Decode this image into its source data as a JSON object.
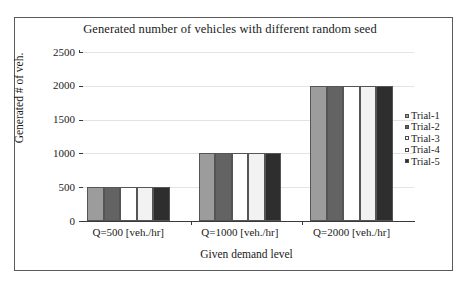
{
  "figure": {
    "background_color": "#ffffff",
    "frame_color": "#5a5a5a"
  },
  "chart_data": {
    "type": "bar",
    "title": "Generated number of vehicles with different random seed",
    "xlabel": "Given demand level",
    "ylabel": "Generated # of veh.",
    "categories": [
      "Q=500 [veh./hr]",
      "Q=1000 [veh./hr]",
      "Q=2000 [veh./hr]"
    ],
    "series": [
      {
        "name": "Trial-1",
        "values": [
          500,
          1000,
          2000
        ],
        "color": "#9c9c9c"
      },
      {
        "name": "Trial-2",
        "values": [
          500,
          1000,
          2000
        ],
        "color": "#636363"
      },
      {
        "name": "Trial-3",
        "values": [
          500,
          1000,
          2000
        ],
        "color": "#ffffff"
      },
      {
        "name": "Trial-4",
        "values": [
          500,
          1000,
          2000
        ],
        "color": "#f2f2f2"
      },
      {
        "name": "Trial-5",
        "values": [
          500,
          1000,
          2000
        ],
        "color": "#2e2e2e"
      }
    ],
    "ylim": [
      0,
      2500
    ],
    "yticks": [
      0,
      500,
      1000,
      1500,
      2000,
      2500
    ],
    "ytick_labels": [
      "0",
      "500",
      "1000",
      "1500",
      "2000",
      "2500"
    ],
    "grid": "horizontal",
    "legend_position": "right",
    "bar_edge_color": "#555555",
    "grid_color": "#e3e3e3",
    "axis_color": "#3a3a3a"
  }
}
